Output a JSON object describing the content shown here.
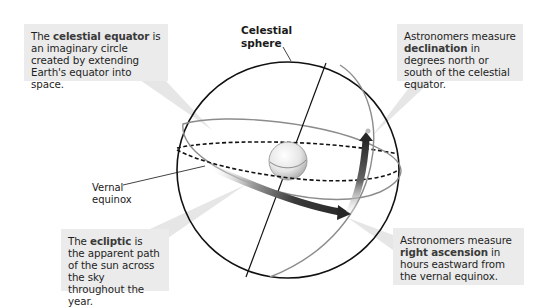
{
  "diagram": {
    "title": "Celestial sphere",
    "labels": {
      "sphere_line1": "Celestial",
      "sphere_line2": "sphere",
      "vernal_line1": "Vernal",
      "vernal_line2": "equinox"
    },
    "callouts": {
      "equator": {
        "pre": "The ",
        "term": "celestial equator",
        "post": " is an imaginary circle created by extending Earth's equator into space."
      },
      "declination": {
        "pre": "Astronomers measure ",
        "term": "declination",
        "post": " in degrees north or south of the celestial equator."
      },
      "ecliptic": {
        "pre": "The ",
        "term": "ecliptic",
        "post": " is the apparent path of the sun across the sky throughout the year."
      },
      "right_ascension": {
        "pre": "Astronomers measure ",
        "term": "right ascension",
        "post": " in hours eastward from the vernal equinox."
      }
    },
    "colors": {
      "callout_bg": "#ebebeb",
      "pointer": "#e4e4e4",
      "sphere_outline": "#111111",
      "ecliptic_ring": "#8a8a8a",
      "arrow_dark": "#2b2b2b"
    }
  }
}
